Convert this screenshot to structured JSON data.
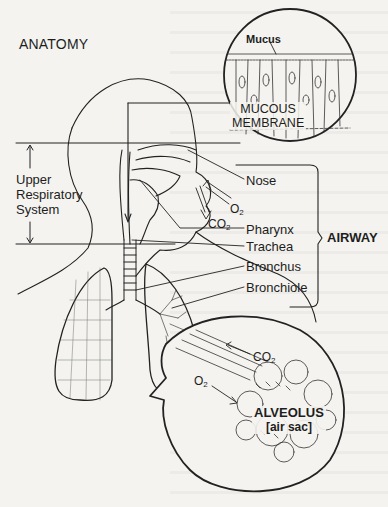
{
  "figure": {
    "title": "ANATOMY",
    "region_label": "Upper Respiratory System",
    "region_label_lines": [
      "Upper",
      "Respiratory",
      "System"
    ],
    "inset_top": {
      "label_top": "Mucus",
      "label_main_line1": "MUCOUS",
      "label_main_line2": "MEMBRANE"
    },
    "airway_labels": [
      "Nose",
      "Pharynx",
      "Trachea",
      "Bronchus",
      "Bronchiole"
    ],
    "airway_group_label": "AIRWAY",
    "gas_labels_nose": {
      "in": "O",
      "in_sub": "2",
      "out": "CO",
      "out_sub": "2"
    },
    "inset_bottom": {
      "co2": "CO",
      "co2_sub": "2",
      "o2": "O",
      "o2_sub": "2",
      "label_line1": "ALVEOLUS",
      "label_line2": "[air sac]"
    }
  },
  "colors": {
    "paper": "#f4f3ef",
    "ink": "#1d1d1d"
  }
}
